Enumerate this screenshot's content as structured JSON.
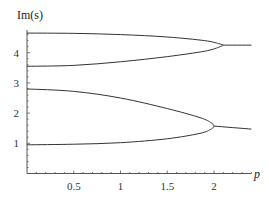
{
  "chart_data": {
    "type": "line",
    "title": "",
    "xlabel": "p",
    "ylabel": "Im(s)",
    "xlim": [
      0,
      2.4
    ],
    "ylim": [
      0,
      4.7
    ],
    "grid": false,
    "legend": null,
    "x_ticks": [
      "0.5",
      "1",
      "1.5",
      "2"
    ],
    "y_ticks": [
      "1",
      "2",
      "3",
      "4"
    ],
    "series": [
      {
        "name": "upper-branch-top",
        "x": [
          0,
          0.5,
          1,
          1.5,
          1.9,
          2.05,
          2.1
        ],
        "y": [
          4.65,
          4.64,
          4.6,
          4.52,
          4.4,
          4.3,
          4.25
        ]
      },
      {
        "name": "upper-branch-bottom",
        "x": [
          0,
          0.5,
          1,
          1.5,
          1.9,
          2.05,
          2.1
        ],
        "y": [
          3.55,
          3.58,
          3.7,
          3.87,
          4.05,
          4.18,
          4.25
        ]
      },
      {
        "name": "upper-merged",
        "x": [
          2.1,
          2.4
        ],
        "y": [
          4.25,
          4.25
        ]
      },
      {
        "name": "lower-branch-top",
        "x": [
          0,
          0.5,
          1,
          1.5,
          1.85,
          1.97,
          2.0
        ],
        "y": [
          2.8,
          2.72,
          2.5,
          2.15,
          1.85,
          1.68,
          1.57
        ]
      },
      {
        "name": "lower-branch-bottom",
        "x": [
          0,
          0.5,
          1,
          1.5,
          1.85,
          1.97,
          2.0
        ],
        "y": [
          0.95,
          0.97,
          1.02,
          1.15,
          1.33,
          1.47,
          1.57
        ]
      },
      {
        "name": "lower-merged",
        "x": [
          2.0,
          2.4
        ],
        "y": [
          1.57,
          1.47
        ]
      }
    ]
  },
  "axes": {
    "y_title": "Im(s)",
    "x_title": "p",
    "x_tick_labels": [
      {
        "v": 0.5,
        "label": "0.5"
      },
      {
        "v": 1,
        "label": "1"
      },
      {
        "v": 1.5,
        "label": "1.5"
      },
      {
        "v": 2,
        "label": "2"
      }
    ],
    "y_tick_labels": [
      {
        "v": 1,
        "label": "1"
      },
      {
        "v": 2,
        "label": "2"
      },
      {
        "v": 3,
        "label": "3"
      },
      {
        "v": 4,
        "label": "4"
      }
    ]
  },
  "colors": {
    "line": "#333333",
    "axis": "#555555"
  }
}
